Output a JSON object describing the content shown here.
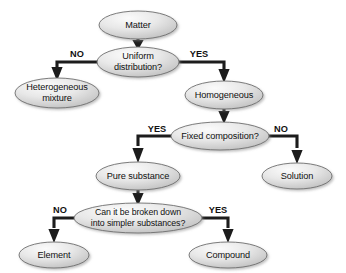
{
  "diagram": {
    "type": "decision-flowchart",
    "background_color": "#ffffff",
    "node_fill_light": "#f2f2f2",
    "node_fill_dark": "#bdbdbd",
    "node_border_color": "#6e6e6e",
    "connector_color": "#1c1c1c",
    "text_color": "#111111"
  },
  "nodes": {
    "matter": {
      "label": "Matter",
      "cx": 138,
      "cy": 25,
      "rx": 39,
      "ry": 14
    },
    "uniform_distribution": {
      "line1": "Uniform",
      "line2": "distribution?",
      "cx": 138,
      "cy": 62,
      "rx": 41,
      "ry": 15
    },
    "heterogeneous_mixture": {
      "line1": "Heterogeneous",
      "line2": "mixture",
      "cx": 57,
      "cy": 93,
      "rx": 42,
      "ry": 15
    },
    "homogeneous": {
      "label": "Homogeneous",
      "cx": 224,
      "cy": 95,
      "rx": 39,
      "ry": 14
    },
    "fixed_composition": {
      "label": "Fixed composition?",
      "cx": 220,
      "cy": 136,
      "rx": 49,
      "ry": 14
    },
    "pure_substance": {
      "label": "Pure substance",
      "cx": 138,
      "cy": 176,
      "rx": 42,
      "ry": 14
    },
    "solution": {
      "label": "Solution",
      "cx": 297,
      "cy": 176,
      "rx": 35,
      "ry": 13
    },
    "broken_down": {
      "line1": "Can it be broken down",
      "line2": "into simpler substances?",
      "cx": 138,
      "cy": 218,
      "rx": 64,
      "ry": 15
    },
    "element": {
      "label": "Element",
      "cx": 54,
      "cy": 255,
      "rx": 35,
      "ry": 13
    },
    "compound": {
      "label": "Compound",
      "cx": 228,
      "cy": 255,
      "rx": 39,
      "ry": 13
    }
  },
  "branch_labels": {
    "uniform_no": {
      "text": "NO",
      "x": 77,
      "y": 55
    },
    "uniform_yes": {
      "text": "YES",
      "x": 199,
      "y": 55
    },
    "fixed_yes": {
      "text": "YES",
      "x": 157,
      "y": 130
    },
    "fixed_no": {
      "text": "NO",
      "x": 281,
      "y": 130
    },
    "broken_no": {
      "text": "NO",
      "x": 60,
      "y": 211
    },
    "broken_yes": {
      "text": "YES",
      "x": 218,
      "y": 211
    }
  },
  "edges": [
    {
      "from": "matter",
      "to": "uniform_distribution",
      "label": ""
    },
    {
      "from": "uniform_distribution",
      "to": "heterogeneous_mixture",
      "label": "NO"
    },
    {
      "from": "uniform_distribution",
      "to": "homogeneous",
      "label": "YES"
    },
    {
      "from": "homogeneous",
      "to": "fixed_composition",
      "label": ""
    },
    {
      "from": "fixed_composition",
      "to": "pure_substance",
      "label": "YES"
    },
    {
      "from": "fixed_composition",
      "to": "solution",
      "label": "NO"
    },
    {
      "from": "pure_substance",
      "to": "broken_down",
      "label": ""
    },
    {
      "from": "broken_down",
      "to": "element",
      "label": "NO"
    },
    {
      "from": "broken_down",
      "to": "compound",
      "label": "YES"
    }
  ]
}
